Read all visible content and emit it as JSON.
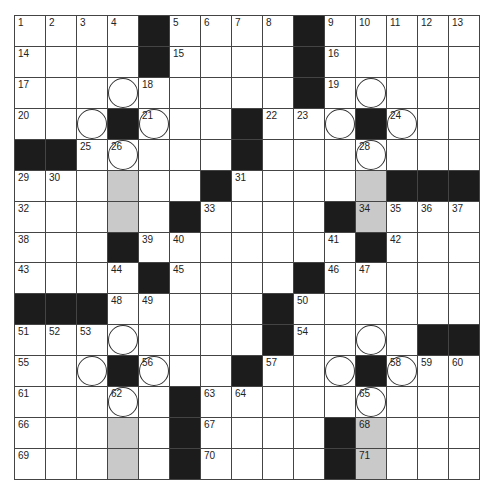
{
  "puzzle": {
    "rows": 15,
    "cols": 15,
    "colors": {
      "black": "#1c1c1c",
      "shaded": "#c9c9c9",
      "white": "#ffffff",
      "grid_line": "#444444"
    },
    "layout": [
      "....#....#.....",
      "....#....#.....",
      ".........#.....",
      "...#...#...#...",
      "##.....#.......",
      "......#.....###",
      ".....#....#....",
      "...#.......#...",
      "....#....#.....",
      "###.....#......",
      "........#....##",
      "...#...#...#...",
      ".....#.........",
      ".....#....#....",
      ".....#....#...."
    ],
    "numbers": {
      "0,0": "1",
      "0,1": "2",
      "0,2": "3",
      "0,3": "4",
      "0,5": "5",
      "0,6": "6",
      "0,7": "7",
      "0,8": "8",
      "0,10": "9",
      "0,11": "10",
      "0,12": "11",
      "0,13": "12",
      "0,14": "13",
      "1,0": "14",
      "1,5": "15",
      "1,10": "16",
      "2,0": "17",
      "2,4": "18",
      "2,10": "19",
      "3,0": "20",
      "3,4": "21",
      "3,8": "22",
      "3,9": "23",
      "3,12": "24",
      "4,2": "25",
      "4,3": "26",
      "4,7": "27",
      "4,11": "28",
      "5,0": "29",
      "5,1": "30",
      "5,7": "31",
      "6,0": "32",
      "6,6": "33",
      "6,11": "34",
      "6,12": "35",
      "6,13": "36",
      "6,14": "37",
      "7,0": "38",
      "7,4": "39",
      "7,5": "40",
      "7,10": "41",
      "7,12": "42",
      "8,0": "43",
      "8,3": "44",
      "8,5": "45",
      "8,10": "46",
      "8,11": "47",
      "9,3": "48",
      "9,4": "49",
      "9,9": "50",
      "10,0": "51",
      "10,1": "52",
      "10,2": "53",
      "10,9": "54",
      "11,0": "55",
      "11,4": "56",
      "11,8": "57",
      "11,12": "58",
      "11,13": "59",
      "11,14": "60",
      "12,0": "61",
      "12,3": "62",
      "12,6": "63",
      "12,7": "64",
      "12,11": "65",
      "13,0": "66",
      "13,6": "67",
      "13,11": "68",
      "14,0": "69",
      "14,6": "70",
      "14,11": "71"
    },
    "circled": [
      "2,3",
      "3,2",
      "3,4",
      "3,10",
      "3,12",
      "2,11",
      "4,3",
      "4,11",
      "10,3",
      "10,11",
      "11,2",
      "11,4",
      "11,10",
      "11,12",
      "12,3",
      "12,11"
    ],
    "shaded": [
      "5,3",
      "6,3",
      "5,11",
      "6,11",
      "13,3",
      "14,3",
      "13,11",
      "14,11"
    ]
  }
}
